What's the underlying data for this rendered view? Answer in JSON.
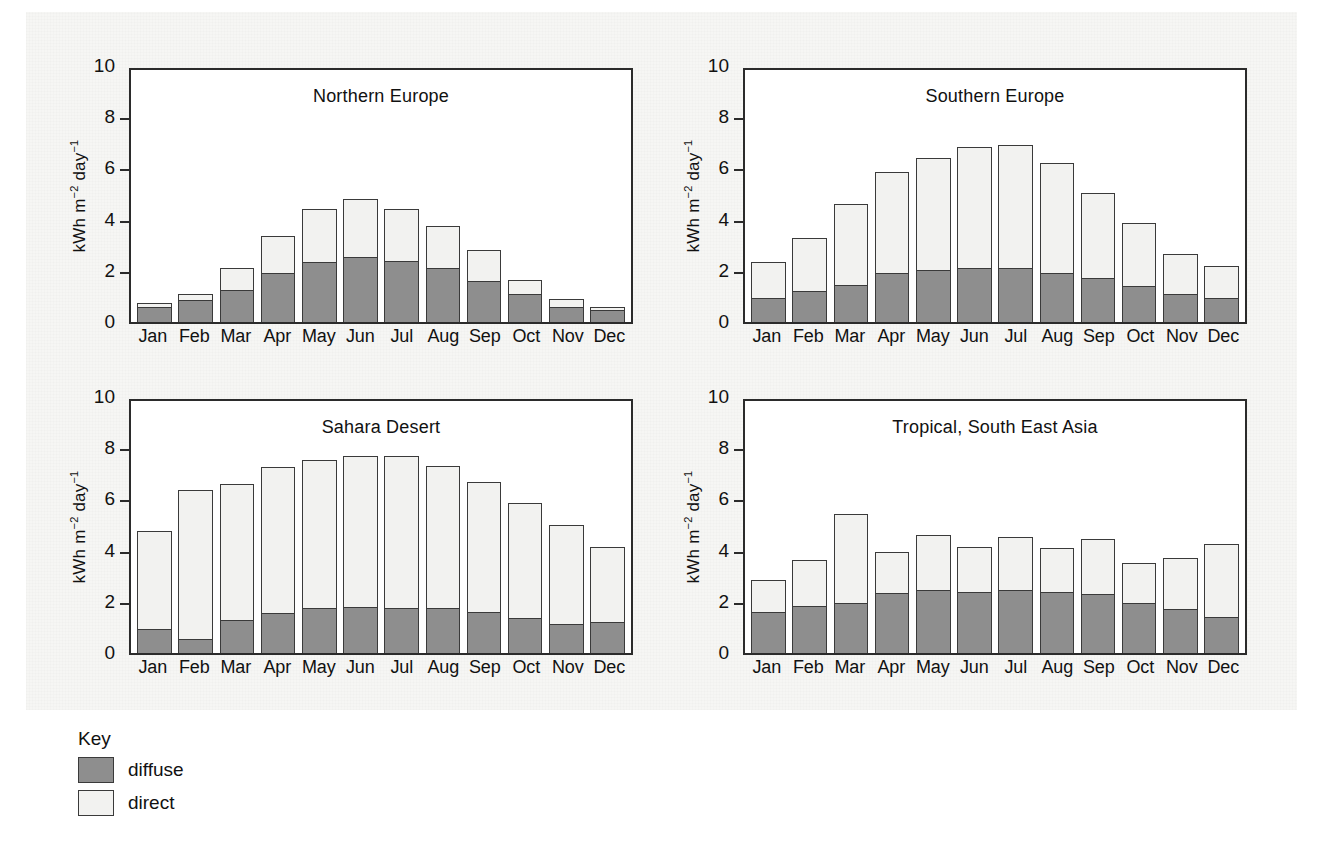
{
  "figure": {
    "background_color": "#f6f6f4",
    "bar_border_color": "#3a3a3a"
  },
  "axis": {
    "y_label_html": "kWh m<sup>&minus;2</sup> day<sup>&minus;1</sup>",
    "y_ticks": [
      "10",
      "8",
      "6",
      "4",
      "2",
      "0"
    ],
    "y_tick_values": [
      10,
      8,
      6,
      4,
      2,
      0
    ]
  },
  "key": {
    "title": "Key",
    "items": [
      {
        "label": "diffuse",
        "color": "#8e8e8e"
      },
      {
        "label": "direct",
        "color": "#f2f2f0"
      }
    ]
  },
  "chart_data": [
    {
      "type": "bar",
      "stacked": true,
      "title": "Northern Europe",
      "xlabel": "",
      "ylabel": "kWh m-2 day-1",
      "ylim": [
        0,
        10
      ],
      "grid": false,
      "legend": "Key: diffuse, direct",
      "categories": [
        "Jan",
        "Feb",
        "Mar",
        "Apr",
        "May",
        "Jun",
        "Jul",
        "Aug",
        "Sep",
        "Oct",
        "Nov",
        "Dec"
      ],
      "series": [
        {
          "name": "diffuse",
          "color": "#8e8e8e",
          "values": [
            0.6,
            0.85,
            1.25,
            1.9,
            2.35,
            2.55,
            2.4,
            2.1,
            1.6,
            1.1,
            0.6,
            0.45
          ]
        },
        {
          "name": "direct",
          "color": "#f2f2f0",
          "values": [
            0.15,
            0.25,
            0.85,
            1.45,
            2.05,
            2.25,
            2.0,
            1.65,
            1.2,
            0.55,
            0.3,
            0.15
          ]
        }
      ],
      "totals": [
        0.75,
        1.1,
        2.1,
        3.35,
        4.4,
        4.8,
        4.4,
        3.75,
        2.8,
        1.65,
        0.9,
        0.6
      ]
    },
    {
      "type": "bar",
      "stacked": true,
      "title": "Southern Europe",
      "xlabel": "",
      "ylabel": "kWh m-2 day-1",
      "ylim": [
        0,
        10
      ],
      "grid": false,
      "legend": "Key: diffuse, direct",
      "categories": [
        "Jan",
        "Feb",
        "Mar",
        "Apr",
        "May",
        "Jun",
        "Jul",
        "Aug",
        "Sep",
        "Oct",
        "Nov",
        "Dec"
      ],
      "series": [
        {
          "name": "diffuse",
          "color": "#8e8e8e",
          "values": [
            0.95,
            1.2,
            1.45,
            1.9,
            2.05,
            2.1,
            2.1,
            1.9,
            1.7,
            1.4,
            1.1,
            0.95
          ]
        },
        {
          "name": "direct",
          "color": "#f2f2f0",
          "values": [
            1.4,
            2.1,
            3.15,
            3.95,
            4.35,
            4.75,
            4.8,
            4.3,
            3.35,
            2.45,
            1.55,
            1.25
          ]
        }
      ],
      "totals": [
        2.35,
        3.3,
        4.6,
        5.85,
        6.4,
        6.85,
        6.9,
        6.2,
        5.05,
        3.85,
        2.65,
        2.2
      ]
    },
    {
      "type": "bar",
      "stacked": true,
      "title": "Sahara Desert",
      "xlabel": "",
      "ylabel": "kWh m-2 day-1",
      "ylim": [
        0,
        10
      ],
      "grid": false,
      "legend": "Key: diffuse, direct",
      "categories": [
        "Jan",
        "Feb",
        "Mar",
        "Apr",
        "May",
        "Jun",
        "Jul",
        "Aug",
        "Sep",
        "Oct",
        "Nov",
        "Dec"
      ],
      "series": [
        {
          "name": "diffuse",
          "color": "#8e8e8e",
          "values": [
            0.95,
            0.55,
            1.3,
            1.55,
            1.75,
            1.8,
            1.75,
            1.75,
            1.6,
            1.35,
            1.15,
            1.2
          ]
        },
        {
          "name": "direct",
          "color": "#f2f2f0",
          "values": [
            3.8,
            5.8,
            5.3,
            5.7,
            5.8,
            5.9,
            5.95,
            5.55,
            5.1,
            4.5,
            3.85,
            2.95
          ]
        }
      ],
      "totals": [
        4.75,
        6.35,
        6.6,
        7.25,
        7.55,
        7.7,
        7.7,
        7.3,
        6.7,
        5.85,
        5.0,
        4.15
      ]
    },
    {
      "type": "bar",
      "stacked": true,
      "title": "Tropical, South East Asia",
      "xlabel": "",
      "ylabel": "kWh m-2 day-1",
      "ylim": [
        0,
        10
      ],
      "grid": false,
      "legend": "Key: diffuse, direct",
      "categories": [
        "Jan",
        "Feb",
        "Mar",
        "Apr",
        "May",
        "Jun",
        "Jul",
        "Aug",
        "Sep",
        "Oct",
        "Nov",
        "Dec"
      ],
      "series": [
        {
          "name": "diffuse",
          "color": "#8e8e8e",
          "values": [
            1.6,
            1.85,
            1.95,
            2.35,
            2.45,
            2.4,
            2.45,
            2.4,
            2.3,
            1.95,
            1.7,
            1.4
          ]
        },
        {
          "name": "direct",
          "color": "#f2f2f0",
          "values": [
            1.25,
            1.8,
            3.5,
            1.6,
            2.15,
            1.75,
            2.1,
            1.7,
            2.15,
            1.55,
            2.0,
            2.85
          ]
        }
      ],
      "totals": [
        2.85,
        3.65,
        5.45,
        3.95,
        4.6,
        4.15,
        4.55,
        4.1,
        4.45,
        3.5,
        3.7,
        4.25
      ]
    }
  ]
}
